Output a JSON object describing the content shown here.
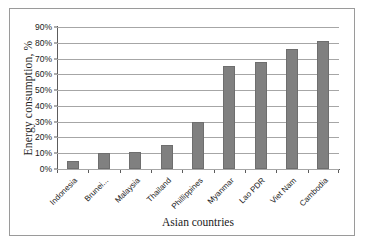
{
  "chart_data": {
    "type": "bar",
    "title": "",
    "xlabel": "Asian countries",
    "ylabel": "Energy consumption, %",
    "categories": [
      "Indonesia",
      "Brunei...",
      "Malaysia",
      "Thailand",
      "Phillippines",
      "Myanmar",
      "Lao PDR",
      "Viet Nam",
      "Cambodia"
    ],
    "values": [
      5,
      10,
      11,
      15,
      30,
      65,
      68,
      76,
      81
    ],
    "series": [
      {
        "name": "Energy consumption",
        "values": [
          5,
          10,
          11,
          15,
          30,
          65,
          68,
          76,
          81
        ]
      }
    ],
    "ylim": [
      0,
      90
    ],
    "ytick_values": [
      0,
      10,
      20,
      30,
      40,
      50,
      60,
      70,
      80,
      90
    ],
    "ytick_labels": [
      "0%",
      "10%",
      "20%",
      "30%",
      "40%",
      "50%",
      "60%",
      "70%",
      "80%",
      "90%"
    ],
    "grid": "horizontal",
    "legend": "none",
    "bar_color": "#808080",
    "gridline_color": "#a6a6a6",
    "axis_color": "#5c5c5c",
    "frame_color": "#9a9a9a",
    "background_color": "#ffffff"
  }
}
